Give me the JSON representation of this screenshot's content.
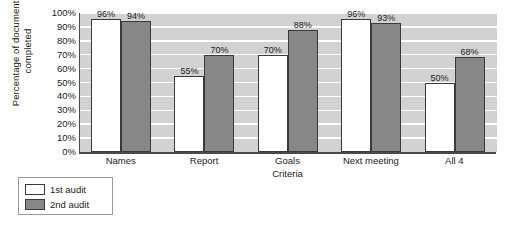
{
  "chart_data": {
    "type": "bar",
    "title": "",
    "xlabel": "Criteria",
    "ylabel": "Percentage of documents\ncompleted",
    "categories": [
      "Names",
      "Report",
      "Goals",
      "Next meeting",
      "All 4"
    ],
    "series": [
      {
        "name": "1st audit",
        "values": [
          96,
          55,
          70,
          96,
          50
        ],
        "color": "#ffffff"
      },
      {
        "name": "2nd audit",
        "values": [
          94,
          70,
          88,
          93,
          68
        ],
        "color": "#878787"
      }
    ],
    "data_labels": [
      [
        "96%",
        "55%",
        "70%",
        "96%",
        "50%"
      ],
      [
        "94%",
        "70%",
        "88%",
        "93%",
        "68%"
      ]
    ],
    "ylim": [
      0,
      100
    ],
    "ytick_values": [
      100,
      90,
      80,
      70,
      60,
      50,
      40,
      30,
      20,
      10,
      0
    ],
    "ytick_labels": [
      "100%",
      "90%",
      "80%",
      "70%",
      "60%",
      "50%",
      "40%",
      "30%",
      "20%",
      "10%",
      "0%"
    ],
    "grid": true,
    "grid_color": "#ffffff",
    "plot_background": "#d2d2d2",
    "legend_position": "below-left",
    "legend_entries": [
      "1st audit",
      "2nd audit"
    ]
  }
}
